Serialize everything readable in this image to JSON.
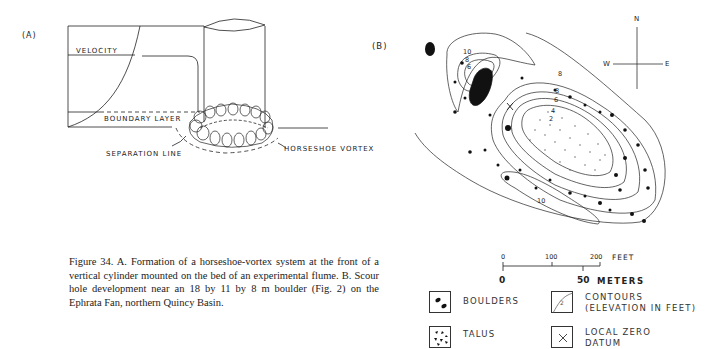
{
  "panel_a": {
    "label": "(A)",
    "velocity_label": "VELOCITY",
    "boundary_layer_label": "BOUNDARY LAYER",
    "separation_line_label": "SEPARATION LINE",
    "horseshoe_vortex_label": "HORSESHOE VORTEX"
  },
  "caption": {
    "text": "Figure 34.   A. Formation of a horseshoe-vortex system at the front of a vertical cylinder mounted on the bed of an experimental flume.  B. Scour hole development near an 18 by 11 by 8 m boulder (Fig. 2) on the Ephrata Fan, northern Quincy Basin."
  },
  "panel_b": {
    "label": "(B)",
    "compass": {
      "n": "N",
      "s": "",
      "e": "E",
      "w": "W"
    },
    "contour_labels": [
      "10",
      "8",
      "6",
      "8",
      "8",
      "6",
      "4",
      "2",
      "10"
    ],
    "scale": {
      "feet_ticks": [
        "0",
        "100",
        "200"
      ],
      "feet_unit": "FEET",
      "meters_ticks": [
        "0",
        "50"
      ],
      "meters_unit": "METERS"
    },
    "legend": [
      {
        "symbol": "boulders",
        "label": "BOULDERS"
      },
      {
        "symbol": "contours",
        "label": "CONTOURS",
        "label2": "(ELEVATION IN FEET)",
        "glyph": "2"
      },
      {
        "symbol": "talus",
        "label": "TALUS"
      },
      {
        "symbol": "local-zero-datum",
        "label": "LOCAL ZERO",
        "label2": "DATUM",
        "glyph": "×"
      }
    ]
  }
}
